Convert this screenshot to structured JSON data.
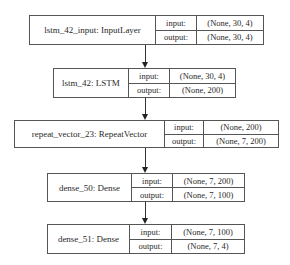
{
  "diagram": {
    "nodes": [
      {
        "name": "lstm_42_input: InputLayer",
        "input_label": "input:",
        "input_value": "(None, 30, 4)",
        "output_label": "output:",
        "output_value": "(None, 30, 4)"
      },
      {
        "name": "lstm_42: LSTM",
        "input_label": "input:",
        "input_value": "(None, 30, 4)",
        "output_label": "output:",
        "output_value": "(None, 200)"
      },
      {
        "name": "repeat_vector_23: RepeatVector",
        "input_label": "input:",
        "input_value": "(None, 200)",
        "output_label": "output:",
        "output_value": "(None, 7, 200)"
      },
      {
        "name": "dense_50: Dense",
        "input_label": "input:",
        "input_value": "(None, 7, 200)",
        "output_label": "output:",
        "output_value": "(None, 7, 100)"
      },
      {
        "name": "dense_51: Dense",
        "input_label": "input:",
        "input_value": "(None, 7, 100)",
        "output_label": "output:",
        "output_value": "(None, 7, 4)"
      }
    ],
    "edges": [
      {
        "from": "lstm_42_input: InputLayer",
        "to": "lstm_42: LSTM"
      },
      {
        "from": "lstm_42: LSTM",
        "to": "repeat_vector_23: RepeatVector"
      },
      {
        "from": "repeat_vector_23: RepeatVector",
        "to": "dense_50: Dense"
      },
      {
        "from": "dense_50: Dense",
        "to": "dense_51: Dense"
      }
    ],
    "colors": {
      "border": "#555555",
      "text": "#2a2a2a",
      "edge": "#333333",
      "background": "#ffffff"
    }
  }
}
